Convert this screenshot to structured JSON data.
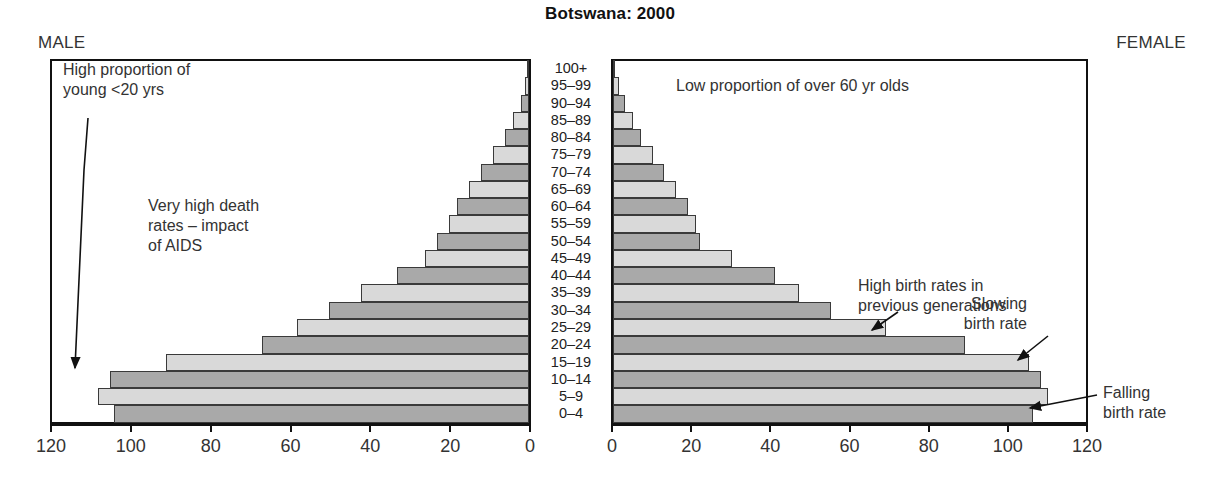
{
  "chart_data": {
    "type": "bar",
    "chart_variant": "population-pyramid",
    "title": "Botswana: 2000",
    "xlabel": "",
    "ylabel": "",
    "grid": false,
    "legend_position": "none",
    "xlim_left": [
      120,
      0
    ],
    "xlim_right": [
      0,
      120
    ],
    "unit_note": "thousands of people per 5-year age band",
    "categories": [
      "100+",
      "95–99",
      "90–94",
      "85–89",
      "80–84",
      "75–79",
      "70–74",
      "65–69",
      "60–64",
      "55–59",
      "50–54",
      "45–49",
      "40–44",
      "35–39",
      "30–34",
      "25–29",
      "20–24",
      "15–19",
      "10–14",
      "5–9",
      "0–4"
    ],
    "series": [
      {
        "name": "MALE",
        "side": "left",
        "axis_ticks": [
          120,
          100,
          80,
          60,
          40,
          20,
          0
        ],
        "values": [
          0.4,
          1,
          2,
          4,
          6,
          9,
          12,
          15,
          18,
          20,
          23,
          26,
          33,
          42,
          50,
          58,
          67,
          91,
          105,
          108,
          104
        ]
      },
      {
        "name": "FEMALE",
        "side": "right",
        "axis_ticks": [
          0,
          20,
          40,
          60,
          80,
          100,
          120
        ],
        "values": [
          0.6,
          1.5,
          3,
          5,
          7,
          10,
          13,
          16,
          19,
          21,
          22,
          30,
          41,
          47,
          55,
          69,
          89,
          105,
          108,
          110,
          106
        ]
      }
    ],
    "annotations": [
      {
        "id": "young",
        "text": "High proportion of\nyoung <20 yrs"
      },
      {
        "id": "aids",
        "text": "Very high death\nrates – impact\nof AIDS"
      },
      {
        "id": "low-old",
        "text": "Low proportion of over 60 yr olds"
      },
      {
        "id": "high-birth",
        "text": "High birth rates in\nprevious generations"
      },
      {
        "id": "slowing",
        "text": "Slowing\nbirth rate"
      },
      {
        "id": "falling",
        "text": "Falling\nbirth rate"
      }
    ]
  },
  "header": {
    "title": "Botswana: 2000"
  },
  "panels": {
    "male_label": "MALE",
    "female_label": "FEMALE"
  },
  "axes": {
    "male_ticks": [
      "120",
      "100",
      "80",
      "60",
      "40",
      "20",
      "0"
    ],
    "female_ticks": [
      "0",
      "20",
      "40",
      "60",
      "80",
      "100",
      "120"
    ]
  },
  "age_labels": [
    "100+",
    "95–99",
    "90–94",
    "85–89",
    "80–84",
    "75–79",
    "70–74",
    "65–69",
    "60–64",
    "55–59",
    "50–54",
    "45–49",
    "40–44",
    "35–39",
    "30–34",
    "25–29",
    "20–24",
    "15–19",
    "10–14",
    "5–9",
    "0–4"
  ],
  "annotations": {
    "young": "High proportion of\nyoung <20 yrs",
    "aids": "Very high death\nrates – impact\nof AIDS",
    "low_old": "Low proportion of over 60 yr olds",
    "high_birth": "High birth rates in\nprevious generations",
    "slowing": "Slowing\nbirth rate",
    "falling": "Falling\nbirth rate"
  },
  "colors": {
    "bar_tone_a": "#a9a9a9",
    "bar_tone_b": "#d9d9d9",
    "bar_outline": "#3a3a3a",
    "axis": "#111111",
    "text": "#333333",
    "background": "#ffffff"
  }
}
